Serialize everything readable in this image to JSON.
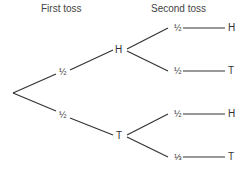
{
  "headers": {
    "first": "First toss",
    "second": "Second toss"
  },
  "tree": {
    "first_level": [
      {
        "outcome": "H",
        "probability": "½"
      },
      {
        "outcome": "T",
        "probability": "½"
      }
    ],
    "second_level": [
      {
        "parent": "H",
        "outcome": "H",
        "probability": "½"
      },
      {
        "parent": "H",
        "outcome": "T",
        "probability": "½"
      },
      {
        "parent": "T",
        "outcome": "H",
        "probability": "½"
      },
      {
        "parent": "T",
        "outcome": "T",
        "probability": "⅓"
      }
    ]
  },
  "colors": {
    "line": "#333333",
    "text": "#333333",
    "background": "#ffffff"
  }
}
